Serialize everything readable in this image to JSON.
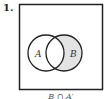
{
  "problem": {
    "number": "1.",
    "circle_a_label": "A",
    "circle_b_label": "B",
    "caption": "B ∩ A′"
  },
  "colors": {
    "shade": "#e3e3e3",
    "stroke": "#222222"
  }
}
